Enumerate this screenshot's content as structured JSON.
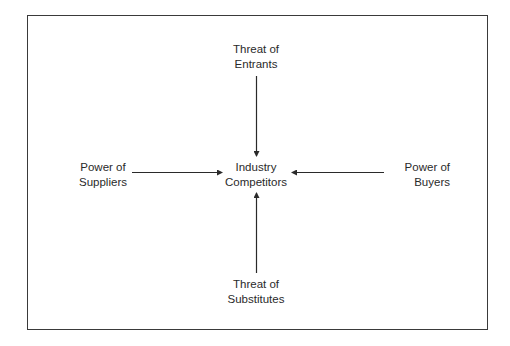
{
  "diagram": {
    "title": "",
    "center": {
      "line1": "Industry",
      "line2": "Competitors"
    },
    "top": {
      "line1": "Threat of",
      "line2": "Entrants"
    },
    "bottom": {
      "line1": "Threat of",
      "line2": "Substitutes"
    },
    "left": {
      "line1": "Power of",
      "line2": "Suppliers"
    },
    "right": {
      "line1": "Power of",
      "line2": "Buyers"
    },
    "colors": {
      "line": "#2a2a2a",
      "background": "#ffffff"
    }
  }
}
